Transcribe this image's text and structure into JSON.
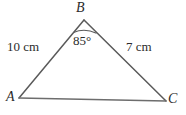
{
  "figure": {
    "type": "triangle-diagram",
    "stroke_color": "#5a5a5a",
    "text_color": "#2b2b2b",
    "background_color": "#ffffff"
  },
  "vertices": {
    "A": {
      "label": "A",
      "x": 19,
      "y": 98
    },
    "B": {
      "label": "B",
      "x": 84,
      "y": 20
    },
    "C": {
      "label": "C",
      "x": 166,
      "y": 101
    }
  },
  "sides": {
    "ab": {
      "label": "10 cm",
      "value": 10,
      "unit": "cm",
      "from": "A",
      "to": "B"
    },
    "bc": {
      "label": "7 cm",
      "value": 7,
      "unit": "cm",
      "from": "B",
      "to": "C"
    },
    "ac": {
      "label": "",
      "from": "A",
      "to": "C"
    }
  },
  "angles": {
    "b": {
      "label": "85°",
      "value": 85,
      "unit": "degrees",
      "at": "B",
      "arc": true
    }
  }
}
